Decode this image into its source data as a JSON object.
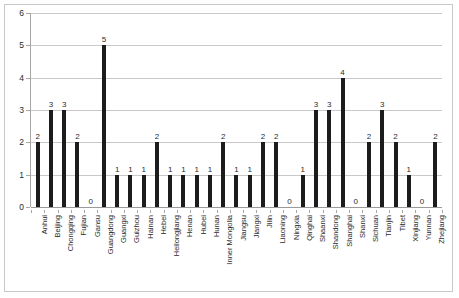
{
  "chart_data": {
    "type": "bar",
    "title": "",
    "subtitle": "",
    "xlabel": "",
    "ylabel": "",
    "ylim": [
      0,
      6
    ],
    "y_ticks": [
      0,
      1,
      2,
      3,
      4,
      5,
      6
    ],
    "grid": true,
    "legend": false,
    "legend_position": "none",
    "bar_color": "#1c1c1c",
    "gridline_color": "#c9c9c9",
    "axis_color": "#a6a6a6",
    "show_data_labels": true,
    "categories": [
      "Anhui",
      "Beijing",
      "Chongqing",
      "Fujian",
      "Gansu",
      "Guangdong",
      "Guangxi",
      "Guizhou",
      "Hainan",
      "Hebei",
      "Heilongjiang",
      "Henan",
      "Hubei",
      "Hunan",
      "Inner Mongolia",
      "Jiangsu",
      "Jiangxi",
      "Jilin",
      "Liaoning",
      "Ningxia",
      "Qinghai",
      "Shaanxi",
      "Shandong",
      "Shanghai",
      "Shanxi",
      "Sichuan",
      "Tianjin",
      "Tibet",
      "Xinjiang",
      "Yunnan",
      "Zhejiang"
    ],
    "values": [
      2,
      3,
      3,
      2,
      0,
      5,
      1,
      1,
      1,
      2,
      1,
      1,
      1,
      1,
      2,
      1,
      1,
      2,
      2,
      0,
      1,
      3,
      3,
      4,
      0,
      2,
      3,
      2,
      1,
      0,
      2
    ]
  }
}
